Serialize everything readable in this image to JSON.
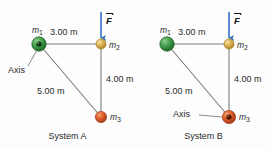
{
  "figure": {
    "background_color": "#fdfdfd"
  },
  "colors": {
    "mass1_sphere": "#3f9b46",
    "mass1_sphere_dark": "#1f6b2a",
    "mass2_sphere": "#e0b65a",
    "mass2_sphere_dark": "#b98c2c",
    "mass3_sphere": "#e2622c",
    "mass3_sphere_dark": "#a8391a",
    "force_arrow": "#2f6fc4",
    "rod": "#7d7d7d",
    "axis_leader": "#6d6d6d",
    "text": "#2b2b2b",
    "axis_dot": "#1b1b1b"
  },
  "systems": [
    {
      "id": "system-a",
      "caption": "System A",
      "axis_label": "Axis",
      "axis_at": "m1",
      "force_label": "F",
      "masses": [
        {
          "id": "m1",
          "label": "m",
          "subscript": "1",
          "color_key": "mass1_sphere",
          "has_axis_marker": true
        },
        {
          "id": "m2",
          "label": "m",
          "subscript": "2",
          "color_key": "mass2_sphere",
          "has_axis_marker": false
        },
        {
          "id": "m3",
          "label": "m",
          "subscript": "3",
          "color_key": "mass3_sphere",
          "has_axis_marker": false
        }
      ],
      "dimensions": [
        {
          "id": "m1-m2",
          "value": "3.00 m"
        },
        {
          "id": "m2-m3",
          "value": "4.00 m"
        },
        {
          "id": "m1-m3",
          "value": "5.00 m"
        }
      ]
    },
    {
      "id": "system-b",
      "caption": "System B",
      "axis_label": "Axis",
      "axis_at": "m3",
      "force_label": "F",
      "masses": [
        {
          "id": "m1",
          "label": "m",
          "subscript": "1",
          "color_key": "mass1_sphere",
          "has_axis_marker": false
        },
        {
          "id": "m2",
          "label": "m",
          "subscript": "2",
          "color_key": "mass2_sphere",
          "has_axis_marker": false
        },
        {
          "id": "m3",
          "label": "m",
          "subscript": "3",
          "color_key": "mass3_sphere",
          "has_axis_marker": true
        }
      ],
      "dimensions": [
        {
          "id": "m1-m2",
          "value": "3.00 m"
        },
        {
          "id": "m2-m3",
          "value": "4.00 m"
        },
        {
          "id": "m1-m3",
          "value": "5.00 m"
        }
      ]
    }
  ]
}
